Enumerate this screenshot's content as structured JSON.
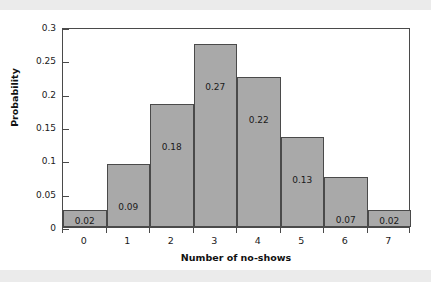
{
  "figure": {
    "background_color": "#ffffff",
    "band_color": "#ebebeb",
    "bar_fill_color": "#a9a9a9",
    "bar_edge_color": "#4a4a4a",
    "axis_color": "#4a4a4a"
  },
  "chart_data": {
    "type": "bar",
    "title": "",
    "subtitle": "",
    "xlabel": "Number of no-shows",
    "ylabel": "Probability",
    "categories": [
      "0",
      "1",
      "2",
      "3",
      "4",
      "5",
      "6",
      "7"
    ],
    "values": [
      0.025,
      0.095,
      0.185,
      0.275,
      0.225,
      0.135,
      0.075,
      0.025
    ],
    "data_labels": [
      "0.02",
      "0.09",
      "0.18",
      "0.27",
      "0.22",
      "0.13",
      "0.07",
      "0.02"
    ],
    "ylim": [
      0,
      0.3
    ],
    "xlim": [
      -0.5,
      7.5
    ],
    "yticks": [
      0,
      0.05,
      0.1,
      0.15,
      0.2,
      0.25,
      0.3
    ],
    "ytick_labels": [
      "0",
      "0.05",
      "0.1",
      "0.15",
      "0.2",
      "0.25",
      "0.3"
    ],
    "xtick_labels": [
      "0",
      "1",
      "2",
      "3",
      "4",
      "5",
      "6",
      "7"
    ],
    "grid": false,
    "legend": null,
    "legend_position": "none",
    "bar_gap": 0,
    "annotations": []
  }
}
